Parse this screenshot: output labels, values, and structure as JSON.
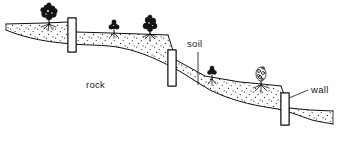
{
  "figure": {
    "background_color": "#ffffff",
    "ink_color": "#101010",
    "width": 339,
    "height": 143
  },
  "labels": [
    {
      "id": "rock",
      "text": "rock",
      "x": 86,
      "y": 88,
      "anchor": "start",
      "has_leader": false
    },
    {
      "id": "soil",
      "text": "soil",
      "x": 187,
      "y": 47,
      "anchor": "start",
      "has_leader": true,
      "leader": {
        "x1": 198,
        "y1": 52,
        "x2": 198,
        "y2": 85
      }
    },
    {
      "id": "wall",
      "text": "wall",
      "x": 311,
      "y": 93,
      "anchor": "start",
      "has_leader": true,
      "leader": {
        "x1": 308,
        "y1": 90,
        "x2": 289,
        "y2": 98
      }
    }
  ],
  "walls": [
    {
      "id": "wall-1",
      "x": 68,
      "y": 18,
      "width": 8,
      "height": 34
    },
    {
      "id": "wall-2",
      "x": 168,
      "y": 50,
      "width": 8,
      "height": 36
    },
    {
      "id": "wall-3",
      "x": 281,
      "y": 93,
      "width": 8,
      "height": 32
    }
  ],
  "terrain": {
    "surface_path": "M 6 24 L 45 23 L 68 22 L 76 32 L 110 33 L 140 34 L 168 35 L 176 60 L 205 76 L 240 82 L 262 84 L 281 86 L 289 108 L 310 110 L 333 111",
    "rock_path": "M 6 30 C 20 36 40 41 62 43 C 86 46 104 44 122 48 C 142 52 158 60 172 67 C 184 73 196 82 210 90 C 228 99 250 105 272 108 C 286 110 300 116 312 120 C 320 122 328 123 333 124",
    "soil_note": "stippled band between the terrace surface and the rock boundary"
  },
  "plants": [
    {
      "id": "plant-1",
      "cx": 49,
      "cy": 13,
      "size": 11,
      "style": "dark",
      "ground_y": 24
    },
    {
      "id": "plant-2",
      "cx": 114,
      "cy": 26,
      "size": 6,
      "style": "dark",
      "ground_y": 33
    },
    {
      "id": "plant-3",
      "cx": 150,
      "cy": 24,
      "size": 10,
      "style": "dark",
      "ground_y": 34
    },
    {
      "id": "plant-4",
      "cx": 212,
      "cy": 71,
      "size": 5,
      "style": "dark",
      "ground_y": 79
    },
    {
      "id": "plant-5",
      "cx": 261,
      "cy": 75,
      "size": 9,
      "style": "open",
      "ground_y": 85
    }
  ]
}
